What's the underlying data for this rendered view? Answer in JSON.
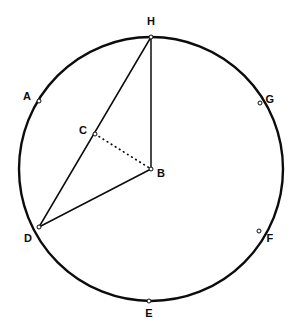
{
  "figure": {
    "type": "circle-geometry-diagram",
    "canvas": {
      "width": 295,
      "height": 333
    },
    "colors": {
      "background": "#ffffff",
      "stroke": "#0c0c0c",
      "label": "#0c0c0c",
      "vertex_fill": "#ffffff"
    },
    "circle": {
      "name": "main-circle",
      "center_label": "B",
      "cx": 151,
      "cy": 169,
      "r": 132,
      "stroke_width": 2.4
    },
    "points": [
      {
        "id": "H",
        "label": "H",
        "x": 151,
        "y": 37,
        "label_x": 151,
        "label_y": 21,
        "on_circle": true,
        "marker": true
      },
      {
        "id": "A",
        "label": "A",
        "x": 39,
        "y": 101,
        "label_x": 27,
        "label_y": 96,
        "on_circle": true,
        "marker": true
      },
      {
        "id": "G",
        "label": "G",
        "x": 260,
        "y": 103,
        "label_x": 270,
        "label_y": 99,
        "on_circle": true,
        "marker": true
      },
      {
        "id": "C",
        "label": "C",
        "x": 95,
        "y": 134,
        "label_x": 83,
        "label_y": 130,
        "on_circle": false,
        "marker": true
      },
      {
        "id": "B",
        "label": "B",
        "x": 151,
        "y": 169,
        "label_x": 161,
        "label_y": 173,
        "on_circle": false,
        "marker": true
      },
      {
        "id": "D",
        "label": "D",
        "x": 39,
        "y": 227,
        "label_x": 28,
        "label_y": 238,
        "on_circle": true,
        "marker": true
      },
      {
        "id": "F",
        "label": "F",
        "x": 259,
        "y": 231,
        "label_x": 270,
        "label_y": 238,
        "on_circle": true,
        "marker": true
      },
      {
        "id": "E",
        "label": "E",
        "x": 149,
        "y": 301,
        "label_x": 149,
        "label_y": 313,
        "on_circle": true,
        "marker": true
      }
    ],
    "segments": [
      {
        "id": "DH",
        "from": "D",
        "to": "H",
        "style": "solid",
        "x1": 39,
        "y1": 227,
        "x2": 151,
        "y2": 37,
        "stroke_width": 1.5
      },
      {
        "id": "HB",
        "from": "H",
        "to": "B",
        "style": "solid",
        "x1": 151,
        "y1": 37,
        "x2": 151,
        "y2": 169,
        "stroke_width": 1.5
      },
      {
        "id": "DB",
        "from": "D",
        "to": "B",
        "style": "solid",
        "x1": 39,
        "y1": 227,
        "x2": 151,
        "y2": 169,
        "stroke_width": 1.5
      },
      {
        "id": "CB",
        "from": "C",
        "to": "B",
        "style": "dotted",
        "x1": 95,
        "y1": 134,
        "x2": 151,
        "y2": 169,
        "stroke_width": 1.7
      }
    ]
  }
}
